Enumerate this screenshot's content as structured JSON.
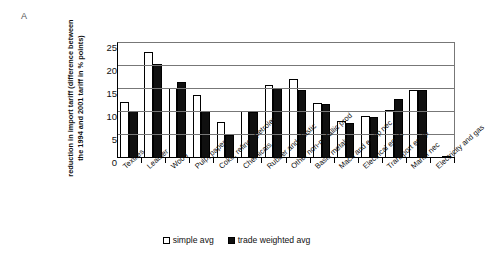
{
  "panel": {
    "letter": "A"
  },
  "legend": {
    "simple_label": "simple avg",
    "weighted_label": "trade weighted avg",
    "simple_color": "#ffffff",
    "weighted_color": "#101010"
  },
  "axis": {
    "y_title": "reduction in import tariff (difference between the 1994 and 2001 tariff in % points)",
    "y_ticks": [
      "0",
      "5",
      "10",
      "15",
      "20",
      "25"
    ]
  },
  "chart_data": {
    "type": "bar",
    "title": "",
    "subtitle": "",
    "xlabel": "",
    "ylabel": "reduction in import tariff (difference between the 1994 and 2001 tariff in % points)",
    "ylim": [
      0,
      25
    ],
    "ytick_values": [
      0,
      5,
      10,
      15,
      20,
      25
    ],
    "grid": true,
    "legend_position": "bottom",
    "categories": [
      "Textiles",
      "Leather",
      "Wood",
      "Pulp, paper",
      "Coke, refined petroleum",
      "Chemicals",
      "Rubber and plastic",
      "Other non-metallic prod",
      "Basic metals",
      "Mach and equip nec",
      "Electrical equip",
      "Transport equip",
      "Manuf nec",
      "Electricity and gas"
    ],
    "series": [
      {
        "name": "simple avg",
        "color": "#ffffff",
        "values": [
          12.1,
          23.1,
          15.2,
          13.8,
          7.9,
          10.2,
          15.9,
          17.1,
          12.0,
          8.0,
          9.1,
          10.5,
          14.8,
          0.0
        ]
      },
      {
        "name": "trade weighted avg",
        "color": "#101010",
        "values": [
          10.2,
          20.5,
          16.5,
          10.2,
          5.0,
          9.9,
          15.3,
          14.8,
          11.7,
          7.7,
          8.9,
          12.8,
          14.8,
          0.3
        ]
      }
    ]
  }
}
